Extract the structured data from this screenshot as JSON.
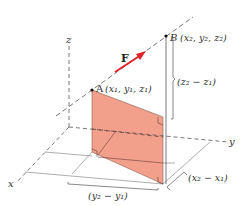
{
  "diagram": {
    "axes": {
      "x_label": "x",
      "y_label": "y",
      "z_label": "z"
    },
    "points": {
      "A": {
        "name": "A",
        "coords": "(x₁, y₁, z₁)"
      },
      "B": {
        "name": "B",
        "coords": "(x₂, y₂, z₂)"
      }
    },
    "force_label": "F",
    "dimensions": {
      "dz": "(z₂ − z₁)",
      "dx": "(x₂ − x₁)",
      "dy": "(y₂ − y₁)"
    },
    "colors": {
      "shaded_plane": "#f2a08c",
      "force_arrow": "#e0242a",
      "lines": "#555555"
    }
  }
}
